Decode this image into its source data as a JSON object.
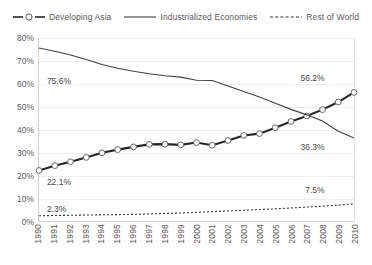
{
  "chart_data": {
    "type": "line",
    "title": "",
    "xlabel": "",
    "ylabel": "",
    "ylim": [
      0,
      80
    ],
    "ytick_labels": [
      "0%",
      "10%",
      "20%",
      "30%",
      "40%",
      "50%",
      "60%",
      "70%",
      "80%"
    ],
    "ytick_values": [
      0,
      10,
      20,
      30,
      40,
      50,
      60,
      70,
      80
    ],
    "grid": true,
    "legend_position": "top",
    "categories": [
      "1990",
      "1991",
      "1992",
      "1993",
      "1994",
      "1995",
      "1996",
      "1997",
      "1998",
      "1999",
      "2000",
      "2001",
      "2002",
      "2003",
      "2004",
      "2005",
      "2006",
      "2007",
      "2008",
      "2009",
      "2010"
    ],
    "series": [
      {
        "name": "Developing Asia",
        "style": "dashed-marker",
        "color": "#262626",
        "values": [
          22.1,
          24.2,
          25.9,
          27.8,
          29.8,
          31.2,
          32.4,
          33.5,
          33.6,
          33.3,
          34.3,
          33.1,
          35.2,
          37.4,
          38.2,
          40.8,
          43.5,
          45.9,
          48.7,
          52.0,
          56.2
        ]
      },
      {
        "name": "Industrialized Economies",
        "style": "solid",
        "color": "#404040",
        "values": [
          75.6,
          74.2,
          72.6,
          70.6,
          68.4,
          66.8,
          65.5,
          64.4,
          63.5,
          62.9,
          61.5,
          61.4,
          59.0,
          56.6,
          54.2,
          51.5,
          48.8,
          46.4,
          43.7,
          39.2,
          36.3
        ]
      },
      {
        "name": "Rest of World",
        "style": "dotted",
        "color": "#333333",
        "values": [
          2.3,
          2.4,
          2.5,
          2.6,
          2.7,
          2.8,
          2.9,
          3.1,
          3.3,
          3.5,
          3.8,
          4.1,
          4.4,
          4.7,
          5.0,
          5.3,
          5.7,
          6.1,
          6.5,
          6.9,
          7.5
        ]
      }
    ],
    "annotations": [
      {
        "text": "75.6%",
        "series": "Industrialized Economies",
        "point": "1990",
        "x_pct": 2.5,
        "y_pct": 20.5
      },
      {
        "text": "22.1%",
        "series": "Developing Asia",
        "point": "1990",
        "x_pct": 2.5,
        "y_pct": 76.0
      },
      {
        "text": "2.3%",
        "series": "Rest of World",
        "point": "1990",
        "x_pct": 2.5,
        "y_pct": 90.5
      },
      {
        "text": "56.2%",
        "series": "Developing Asia",
        "point": "2010",
        "x_pct": 83.0,
        "y_pct": 19.0
      },
      {
        "text": "36.3%",
        "series": "Industrialized Economies",
        "point": "2010",
        "x_pct": 83.0,
        "y_pct": 57.0
      },
      {
        "text": "7.5%",
        "series": "Rest of World",
        "point": "2010",
        "x_pct": 84.5,
        "y_pct": 80.5
      }
    ]
  },
  "legend": {
    "items": [
      {
        "label": "Developing Asia",
        "key": "dashed-circle-marker-key"
      },
      {
        "label": "Industrialized Economies",
        "key": "solid-line-key"
      },
      {
        "label": "Rest of World",
        "key": "dotted-line-key"
      }
    ]
  },
  "colors": {
    "gridline": "#ededed",
    "axis": "#d0d0d0",
    "text": "#5a5a5a",
    "plot_background": "#ffffff"
  }
}
